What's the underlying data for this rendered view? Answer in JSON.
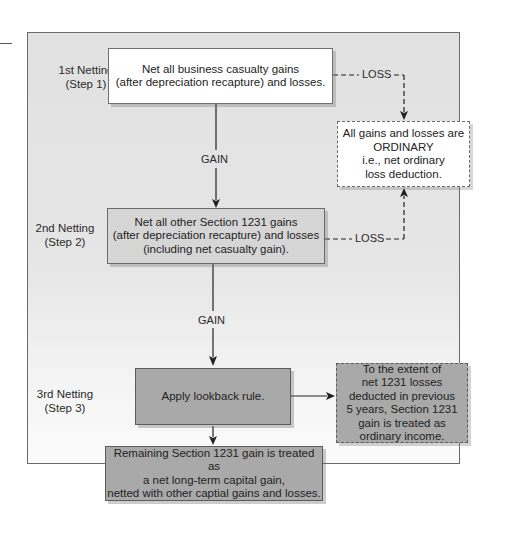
{
  "diagram": {
    "steps": [
      {
        "label_line1": "1st Netting",
        "label_line2": "(Step 1)"
      },
      {
        "label_line1": "2nd Netting",
        "label_line2": "(Step 2)"
      },
      {
        "label_line1": "3rd Netting",
        "label_line2": "(Step 3)"
      }
    ],
    "boxes": {
      "step1": {
        "line1": "Net all business casualty gains",
        "line2": "(after depreciation recapture) and losses."
      },
      "step2": {
        "line1": "Net all other Section 1231 gains",
        "line2": "(after depreciation recapture) and losses",
        "line3": "(including net casualty gain)."
      },
      "ordinary": {
        "line1": "All gains and losses are",
        "line2": "ORDINARY",
        "line3": "i.e., net ordinary",
        "line4": "loss deduction."
      },
      "lookback": {
        "line1": "Apply lookback rule."
      },
      "lookback_result": {
        "line1": "To the extent of",
        "line2": "net 1231 losses",
        "line3": "deducted in previous",
        "line4": "5 years, Section 1231",
        "line5": "gain is treated as",
        "line6": "ordinary income."
      },
      "remaining": {
        "line1": "Remaining Section 1231 gain is treated as",
        "line2": "a net long-term capital gain,",
        "line3": "netted with other captial gains and losses."
      }
    },
    "edge_labels": {
      "gain1": "GAIN",
      "gain2": "GAIN",
      "loss1": "LOSS",
      "loss2": "LOSS"
    },
    "colors": {
      "panel_bg": "#e3e3e3",
      "box_white": "#ffffff",
      "box_light_gray": "#d6d6d6",
      "box_mid_gray": "#a9a9a9",
      "line": "#222222",
      "border": "#6a6a6a"
    }
  }
}
